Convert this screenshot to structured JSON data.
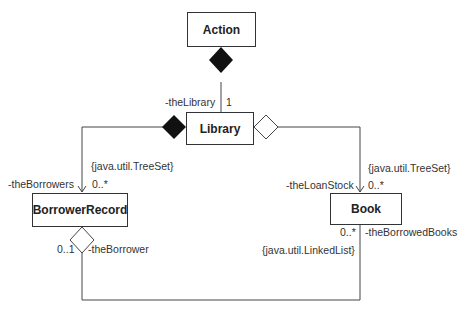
{
  "classes": {
    "action": "Action",
    "library": "Library",
    "borrower_record": "BorrowerRecord",
    "book": "Book"
  },
  "labels": {
    "the_library": "-theLibrary",
    "the_library_mult": "1",
    "borrowers_constraint": "{java.util.TreeSet}",
    "the_borrowers": "-theBorrowers",
    "borrowers_mult": "0..*",
    "loan_constraint": "{java.util.TreeSet}",
    "the_loan_stock": "-theLoanStock",
    "loan_mult": "0..*",
    "borrower_mult": "0..1",
    "the_borrower": "-theBorrower",
    "borrowed_mult": "0..*",
    "the_borrowed_books": "-theBorrowedBooks",
    "borrowed_constraint": "{java.util.LinkedList}"
  }
}
